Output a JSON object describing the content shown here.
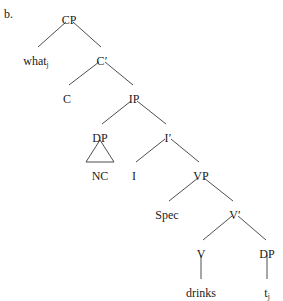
{
  "figure": {
    "label": "b.",
    "type": "syntax-tree"
  },
  "colors": {
    "line": "#3a3a3a",
    "text": "#1a1a1a",
    "background": "#ffffff"
  },
  "tree": {
    "nodes": [
      {
        "id": "cp",
        "label": "CP",
        "x": 69,
        "y": 14,
        "sub": ""
      },
      {
        "id": "what",
        "label": "what",
        "x": 36,
        "y": 55,
        "sub": "j"
      },
      {
        "id": "cbar",
        "label": "C′",
        "x": 102,
        "y": 55,
        "sub": ""
      },
      {
        "id": "c",
        "label": "C",
        "x": 67,
        "y": 93,
        "sub": ""
      },
      {
        "id": "ip",
        "label": "IP",
        "x": 134,
        "y": 93,
        "sub": ""
      },
      {
        "id": "dp1",
        "label": "DP",
        "x": 100,
        "y": 132,
        "sub": ""
      },
      {
        "id": "ibar",
        "label": "I′",
        "x": 168,
        "y": 132,
        "sub": ""
      },
      {
        "id": "nc",
        "label": "NC",
        "x": 100,
        "y": 170,
        "sub": ""
      },
      {
        "id": "i",
        "label": "I",
        "x": 134,
        "y": 170,
        "sub": ""
      },
      {
        "id": "vp",
        "label": "VP",
        "x": 201,
        "y": 170,
        "sub": ""
      },
      {
        "id": "spec",
        "label": "Spec",
        "x": 167,
        "y": 209,
        "sub": ""
      },
      {
        "id": "vbar",
        "label": "V′",
        "x": 235,
        "y": 209,
        "sub": ""
      },
      {
        "id": "v",
        "label": "V",
        "x": 201,
        "y": 248,
        "sub": ""
      },
      {
        "id": "dp2",
        "label": "DP",
        "x": 267,
        "y": 248,
        "sub": ""
      },
      {
        "id": "drinks",
        "label": "drinks",
        "x": 201,
        "y": 287,
        "sub": ""
      },
      {
        "id": "trace",
        "label": "t",
        "x": 267,
        "y": 287,
        "sub": "j"
      }
    ],
    "edges": [
      {
        "from": "cp",
        "to": "what",
        "x1": 66,
        "y1": 22,
        "x2": 38,
        "y2": 47
      },
      {
        "from": "cp",
        "to": "cbar",
        "x1": 73,
        "y1": 22,
        "x2": 101,
        "y2": 47
      },
      {
        "from": "cbar",
        "to": "c",
        "x1": 99,
        "y1": 62,
        "x2": 69,
        "y2": 85
      },
      {
        "from": "cbar",
        "to": "ip",
        "x1": 105,
        "y1": 62,
        "x2": 133,
        "y2": 85
      },
      {
        "from": "ip",
        "to": "dp1",
        "x1": 131,
        "y1": 101,
        "x2": 102,
        "y2": 124
      },
      {
        "from": "ip",
        "to": "ibar",
        "x1": 137,
        "y1": 101,
        "x2": 166,
        "y2": 124
      },
      {
        "from": "ibar",
        "to": "i",
        "x1": 165,
        "y1": 139,
        "x2": 136,
        "y2": 162
      },
      {
        "from": "ibar",
        "to": "vp",
        "x1": 171,
        "y1": 139,
        "x2": 199,
        "y2": 162
      },
      {
        "from": "vp",
        "to": "spec",
        "x1": 198,
        "y1": 178,
        "x2": 169,
        "y2": 201
      },
      {
        "from": "vp",
        "to": "vbar",
        "x1": 204,
        "y1": 178,
        "x2": 233,
        "y2": 201
      },
      {
        "from": "vbar",
        "to": "v",
        "x1": 232,
        "y1": 216,
        "x2": 203,
        "y2": 240
      },
      {
        "from": "vbar",
        "to": "dp2",
        "x1": 238,
        "y1": 216,
        "x2": 266,
        "y2": 240
      },
      {
        "from": "v",
        "to": "drinks",
        "x1": 201,
        "y1": 255,
        "x2": 201,
        "y2": 279
      },
      {
        "from": "dp2",
        "to": "trace",
        "x1": 267,
        "y1": 255,
        "x2": 267,
        "y2": 279
      }
    ],
    "triangles": [
      {
        "under": "dp1",
        "apex_x": 100,
        "apex_y": 140,
        "left_x": 86,
        "right_x": 114,
        "base_y": 162
      }
    ]
  }
}
